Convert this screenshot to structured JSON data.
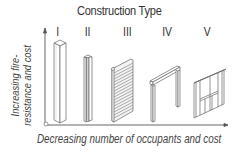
{
  "diagram": {
    "title": "Construction Type",
    "types": [
      {
        "numeral": "I",
        "x": 56,
        "illustration": "concrete-column"
      },
      {
        "numeral": "II",
        "x": 84,
        "illustration": "steel-i-beam-column"
      },
      {
        "numeral": "III",
        "x": 123,
        "illustration": "masonry-wall"
      },
      {
        "numeral": "IV",
        "x": 161,
        "illustration": "heavy-timber-post-and-beam"
      },
      {
        "numeral": "V",
        "x": 203,
        "illustration": "wood-stud-frame-wall"
      }
    ],
    "y_axis_label_line1": "Increasing fire-",
    "y_axis_label_line2": "resistance and cost",
    "x_axis_label": "Decreasing number of occupants and cost",
    "colors": {
      "line": "#555555",
      "text": "#333333",
      "hatch": "#777777"
    }
  }
}
